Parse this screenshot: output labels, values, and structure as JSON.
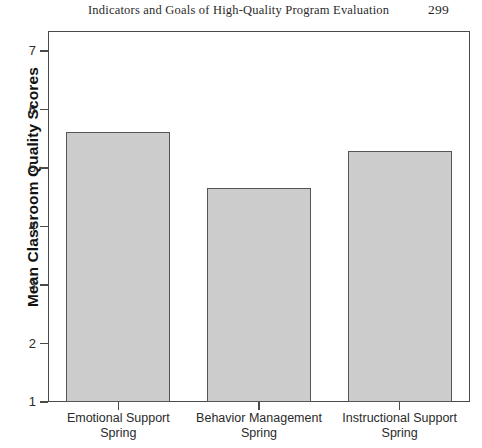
{
  "page": {
    "header_title": "Indicators and Goals of High-Quality Program Evaluation",
    "page_number": "299"
  },
  "chart_data": {
    "type": "bar",
    "title": "",
    "xlabel": "",
    "ylabel": "Mean Classroom Quality Scores",
    "categories": [
      "Emotional Support\nSpring",
      "Behavior Management\nSpring",
      "Instructional Support\nSpring"
    ],
    "category_lines": [
      [
        "Emotional Support",
        "Spring"
      ],
      [
        "Behavior Management",
        "Spring"
      ],
      [
        "Instructional Support",
        "Spring"
      ]
    ],
    "values": [
      5.62,
      4.66,
      5.29
    ],
    "ylim": [
      1,
      7.4
    ],
    "yticks": [
      1,
      2,
      3,
      4,
      5,
      6,
      7
    ],
    "ytick_labels": [
      "1",
      "2",
      "3",
      "4",
      "5",
      "6",
      "7"
    ],
    "grid": false,
    "legend": null,
    "bar_color": "#cccccc",
    "bar_edge_color": "#555555",
    "axis_color": "#4a4a4a"
  }
}
